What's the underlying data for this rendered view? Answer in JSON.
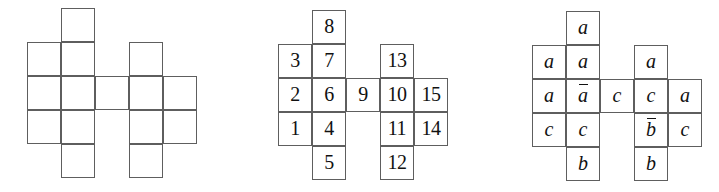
{
  "document": {
    "kind": "cube-net-diagram-row",
    "background": "#ffffff",
    "line_color": "#5e5e5e",
    "text_color": "#111111"
  },
  "layout": {
    "cell_size": 34,
    "figures": [
      {
        "name": "blank-net",
        "origin_x": 27,
        "origin_y": 8
      },
      {
        "name": "numbered-net",
        "origin_x": 278,
        "origin_y": 10
      },
      {
        "name": "lettered-net",
        "origin_x": 532,
        "origin_y": 11
      }
    ],
    "cells": [
      {
        "col": 1,
        "row": 0
      },
      {
        "col": 0,
        "row": 1
      },
      {
        "col": 1,
        "row": 1
      },
      {
        "col": 3,
        "row": 1
      },
      {
        "col": 0,
        "row": 2
      },
      {
        "col": 1,
        "row": 2
      },
      {
        "col": 2,
        "row": 2
      },
      {
        "col": 3,
        "row": 2
      },
      {
        "col": 4,
        "row": 2
      },
      {
        "col": 0,
        "row": 3
      },
      {
        "col": 1,
        "row": 3
      },
      {
        "col": 3,
        "row": 3
      },
      {
        "col": 4,
        "row": 3
      },
      {
        "col": 1,
        "row": 4
      },
      {
        "col": 3,
        "row": 4
      }
    ]
  },
  "figures": {
    "blank": {
      "name": "blank-net",
      "labels": [
        "",
        "",
        "",
        "",
        "",
        "",
        "",
        "",
        "",
        "",
        "",
        "",
        "",
        "",
        ""
      ]
    },
    "numbered": {
      "name": "numbered-net",
      "labels": [
        "8",
        "3",
        "7",
        "13",
        "2",
        "6",
        "9",
        "10",
        "15",
        "1",
        "4",
        "11",
        "14",
        "5",
        "12"
      ]
    },
    "lettered": {
      "name": "lettered-net",
      "labels": [
        "a",
        "a",
        "a",
        "a",
        "a",
        "ā",
        "c",
        "c",
        "a",
        "c",
        "c",
        "b̄",
        "c",
        "b",
        "b"
      ],
      "overlined": [
        false,
        false,
        false,
        false,
        false,
        true,
        false,
        false,
        false,
        false,
        false,
        true,
        false,
        false,
        false
      ]
    }
  }
}
